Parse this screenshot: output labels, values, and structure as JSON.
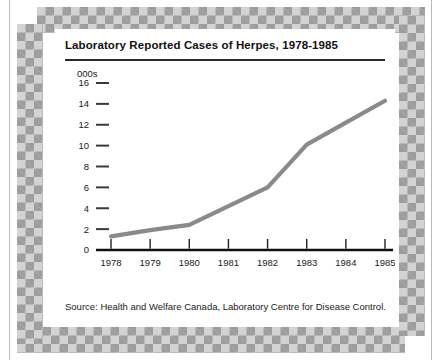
{
  "card": {
    "title": "Laboratory Reported Cases of Herpes, 1978-1985",
    "source": "Source: Health and Welfare Canada, Laboratory Centre for Disease Control."
  },
  "chart_data": {
    "type": "line",
    "title": "Laboratory Reported Cases of Herpes, 1978-1985",
    "xlabel": "",
    "ylabel": "000s",
    "units_label": "000s",
    "categories": [
      "1978",
      "1979",
      "1980",
      "1981",
      "1982",
      "1983",
      "1984",
      "1985"
    ],
    "x": [
      1978,
      1979,
      1980,
      1981,
      1982,
      1983,
      1984,
      1985
    ],
    "values": [
      1.3,
      1.9,
      2.4,
      4.2,
      6.0,
      10.1,
      12.2,
      14.3
    ],
    "series": [
      {
        "name": "Laboratory reported cases of herpes",
        "values": [
          1.3,
          1.9,
          2.4,
          4.2,
          6.0,
          10.1,
          12.2,
          14.3
        ]
      }
    ],
    "ylim": [
      0,
      16
    ],
    "yticks": [
      0,
      2,
      4,
      6,
      8,
      10,
      12,
      14,
      16
    ],
    "ytick_labels": [
      "0",
      "2",
      "4",
      "6",
      "8",
      "10",
      "12",
      "14",
      "16"
    ],
    "xlim": [
      1978,
      1985
    ],
    "grid": false,
    "legend": false,
    "legend_position": "none",
    "line_color": "#8a8a8a",
    "axis_color": "#111111"
  },
  "colors": {
    "series": "#8a8a8a",
    "axis": "#111111",
    "border_dark": "#9d9d9d",
    "border_light": "#d3d3d3",
    "card_background": "#ffffff"
  }
}
